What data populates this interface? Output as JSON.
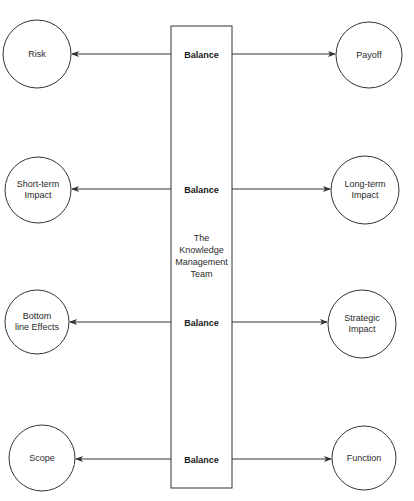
{
  "diagram": {
    "center_box": {
      "label_lines": [
        "The",
        "Knowledge",
        "Management",
        "Team"
      ]
    },
    "rows": [
      {
        "connector": "Balance",
        "left": "Risk",
        "right": "Payoff"
      },
      {
        "connector": "Balance",
        "left": "Short-term\nImpact",
        "right": "Long-term\nImpact"
      },
      {
        "connector": "Balance",
        "left": "Bottom\nline Effects",
        "right": "Strategic\nImpact"
      },
      {
        "connector": "Balance",
        "left": "Scope",
        "right": "Function"
      }
    ],
    "colors": {
      "stroke": "#333333",
      "background": "#ffffff"
    }
  }
}
